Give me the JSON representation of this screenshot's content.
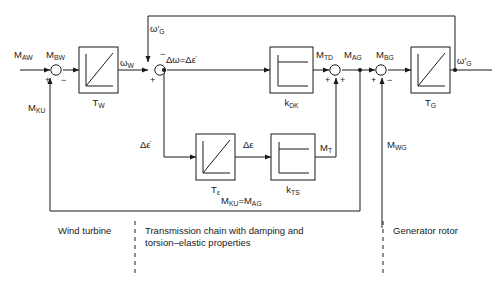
{
  "diagram": {
    "line_color": "#1a1a1a",
    "background": "#ffffff"
  },
  "blocks": [
    {
      "id": "tw",
      "label": "T",
      "sub": "W",
      "icon": "ramp-integrator-icon"
    },
    {
      "id": "kdk",
      "label": "k",
      "sub": "DK",
      "icon": "step-response-icon"
    },
    {
      "id": "tg",
      "label": "T",
      "sub": "G",
      "icon": "ramp-integrator-icon"
    },
    {
      "id": "teps",
      "label": "T",
      "sub": "ε",
      "icon": "ramp-integrator-icon"
    },
    {
      "id": "kts",
      "label": "k",
      "sub": "TS",
      "icon": "step-response-icon"
    }
  ],
  "signals": {
    "m_aw": {
      "base": "M",
      "sub": "AW"
    },
    "m_bw": {
      "base": "M",
      "sub": "BW"
    },
    "m_ku": {
      "base": "M",
      "sub": "KU"
    },
    "omega_w": {
      "text": "ω",
      "sub": "W"
    },
    "omega_g_top": {
      "text": "ω′",
      "sub": "G"
    },
    "omega_g_out": {
      "text": "ω′",
      "sub": "G"
    },
    "delta_omega": {
      "text": "Δω=Δε̇"
    },
    "delta_eps_dot": {
      "text": "Δε̇"
    },
    "delta_eps": {
      "text": "Δε"
    },
    "m_td": {
      "base": "M",
      "sub": "TD"
    },
    "m_ag": {
      "base": "M",
      "sub": "AG"
    },
    "m_bg": {
      "base": "M",
      "sub": "BG"
    },
    "m_t": {
      "base": "M",
      "sub": "T"
    },
    "m_wg": {
      "base": "M",
      "sub": "WG"
    },
    "equality": {
      "text": "M_KU = M_AG"
    }
  },
  "signs": {
    "sum1_left": "+",
    "sum1_bottom": "−",
    "sum2_left": "+",
    "sum2_top": "−",
    "sum3_left": "+",
    "sum3_bottom": "+",
    "sum4_left": "+",
    "sum4_bottom": "−"
  },
  "sections": [
    {
      "id": "wind-turbine",
      "text": "Wind turbine"
    },
    {
      "id": "transmission-chain",
      "text": "Transmission chain with damping and\ntorsion–elastic properties"
    },
    {
      "id": "generator-rotor",
      "text": "Generator rotor"
    }
  ]
}
